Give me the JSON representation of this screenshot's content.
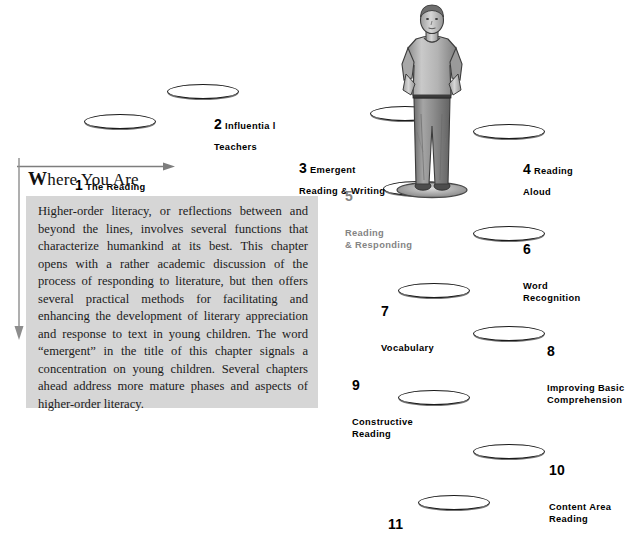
{
  "page": {
    "title": "Where You Are",
    "heading_drop_cap": "W",
    "heading_rest": "here You Are",
    "body_text": "Higher-order literacy, or reflections between and beyond the lines, involves several functions that characterize humankind at its best. This chapter opens with a rather academic discussion of the process of responding to literature, but then offers several practical methods for facilitating and enhancing the development of literary appreciation and response to text in young children. The word “emergent” in the title of this chapter signals a concentration on young children. Several chapters ahead address more mature phases and aspects of higher-order literacy.",
    "box_background_color": "#d6d6d6",
    "current_step_color": "#848484",
    "text_color": "#000000"
  },
  "illustration": {
    "name": "standing-man-figure",
    "description": "Grayscale illustration of a man standing with hands in pockets on a stepping stone"
  },
  "steps": [
    {
      "number": "1",
      "label": "The Reading\nProcess",
      "current": false
    },
    {
      "number": "2",
      "label": "Influentia l\nTeachers",
      "current": false
    },
    {
      "number": "3",
      "label": "Emergent\nReading & Writing",
      "current": false
    },
    {
      "number": "4",
      "label": "Reading\nAloud",
      "current": false
    },
    {
      "number": "5",
      "label": "Reading\n& Responding",
      "current": true
    },
    {
      "number": "6",
      "label": "Word\nRecognition",
      "current": false
    },
    {
      "number": "7",
      "label": "Vocabulary",
      "current": false
    },
    {
      "number": "8",
      "label": "Improving Basic\nComprehension",
      "current": false
    },
    {
      "number": "9",
      "label": "Constructive\nReading",
      "current": false
    },
    {
      "number": "10",
      "label": "Content Area\nReading",
      "current": false
    },
    {
      "number": "11",
      "label": "",
      "current": false
    }
  ]
}
